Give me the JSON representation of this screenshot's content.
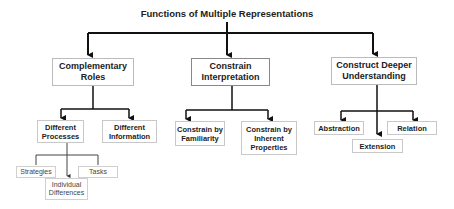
{
  "title": "Functions of Multiple Representations",
  "colors": {
    "line": "#111111",
    "box_border": "#bbbbbb",
    "text": "#222222"
  },
  "level1": [
    {
      "id": "complementary",
      "label": "Complementary Roles"
    },
    {
      "id": "constrain",
      "label": "Constrain Interpretation"
    },
    {
      "id": "construct",
      "label": "Construct Deeper Understanding"
    }
  ],
  "complementary_children": [
    {
      "label": "Different Processes"
    },
    {
      "label": "Different Information"
    }
  ],
  "processes_children": [
    {
      "label": "Strategies"
    },
    {
      "label": "Individual Differences"
    },
    {
      "label": "Tasks"
    }
  ],
  "constrain_children": [
    {
      "label": "Constrain by Familiarity"
    },
    {
      "label": "Constrain by Inherent Properties"
    }
  ],
  "construct_children": [
    {
      "label": "Abstraction"
    },
    {
      "label": "Extension"
    },
    {
      "label": "Relation"
    }
  ]
}
